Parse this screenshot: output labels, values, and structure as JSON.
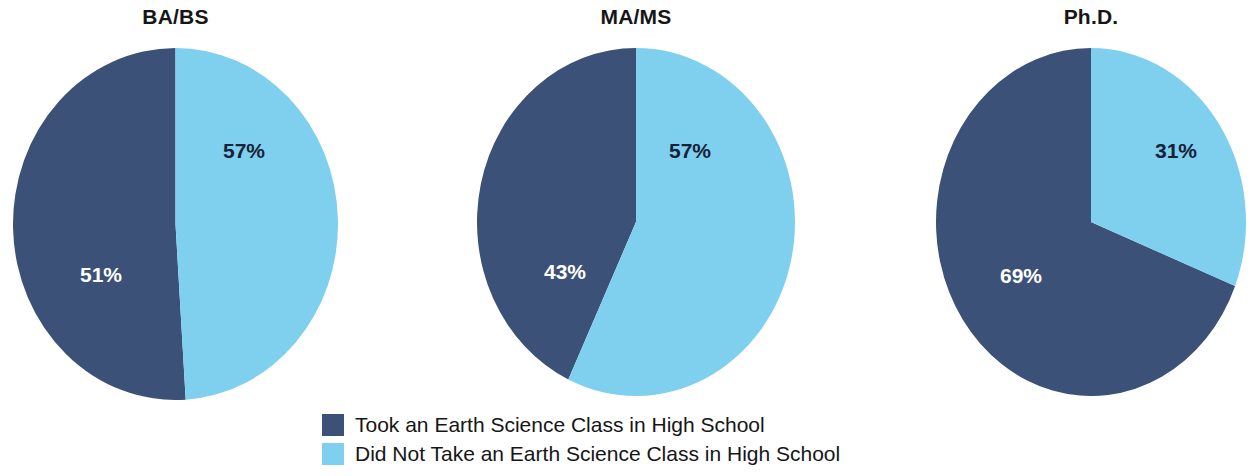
{
  "chart_data": {
    "type": "pie",
    "title": "",
    "panels": [
      {
        "title": "BA/BS",
        "slices": [
          {
            "label": "Took an Earth Science Class in High School",
            "value": 51,
            "display": "51%",
            "color": "#3c5178"
          },
          {
            "label": "Did Not Take an Earth Science Class in High School",
            "value": 49,
            "display": "49%",
            "color": "#7fd0ef"
          }
        ]
      },
      {
        "title": "MA/MS",
        "slices": [
          {
            "label": "Took an Earth Science Class in High School",
            "value": 43,
            "display": "43%",
            "color": "#3c5178"
          },
          {
            "label": "Did Not Take an Earth Science Class in High School",
            "value": 57,
            "display": "57%",
            "color": "#7fd0ef"
          }
        ]
      },
      {
        "title": "Ph.D.",
        "slices": [
          {
            "label": "Took an Earth Science Class in High School",
            "value": 69,
            "display": "69%",
            "color": "#3c5178"
          },
          {
            "label": "Did Not Take an Earth Science Class in High School",
            "value": 31,
            "display": "31%",
            "color": "#7fd0ef"
          }
        ]
      }
    ],
    "legend": {
      "position": "bottom",
      "entries": [
        {
          "label": "Took an Earth Science Class in High School",
          "color": "#3c5178"
        },
        {
          "label": "Did Not Take an Earth Science Class in High School",
          "color": "#7fd0ef"
        }
      ]
    },
    "colors": {
      "took": "#3c5178",
      "did_not_take": "#7fd0ef",
      "background": "#ffffff",
      "label_on_dark": "#ffffff",
      "label_on_light": "#152238"
    }
  }
}
